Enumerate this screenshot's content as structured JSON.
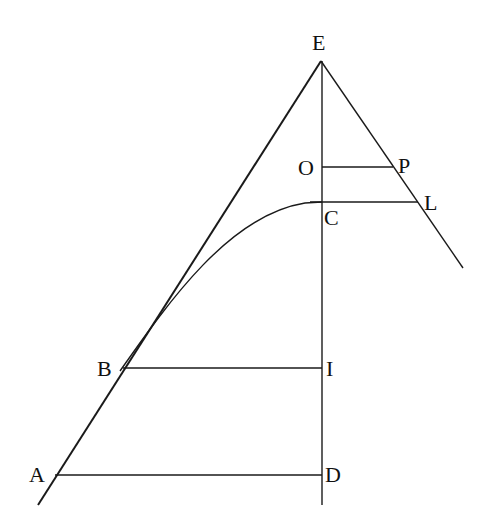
{
  "figure": {
    "type": "geometric-diagram",
    "stroke_color": "#1a1a1a",
    "background": "#ffffff"
  },
  "points": {
    "E": {
      "label": "E",
      "x": 321,
      "y": 61
    },
    "O": {
      "label": "O",
      "x": 322,
      "y": 167
    },
    "P": {
      "label": "P",
      "x": 393,
      "y": 167
    },
    "C": {
      "label": "C",
      "x": 322,
      "y": 202
    },
    "L": {
      "label": "L",
      "x": 418,
      "y": 202
    },
    "B": {
      "label": "B",
      "x": 122,
      "y": 368
    },
    "I": {
      "label": "I",
      "x": 322,
      "y": 368
    },
    "A": {
      "label": "A",
      "x": 55,
      "y": 475
    },
    "D": {
      "label": "D",
      "x": 322,
      "y": 475
    }
  },
  "labels": {
    "E": "E",
    "O": "O",
    "P": "P",
    "C": "C",
    "L": "L",
    "B": "B",
    "I": "I",
    "A": "A",
    "D": "D"
  },
  "segments": [
    {
      "name": "line-EA",
      "from": "E",
      "to": "A-extended"
    },
    {
      "name": "line-EL",
      "from": "E",
      "to": "L-extended"
    },
    {
      "name": "axis-ED",
      "from": "E",
      "to": "D-extended"
    },
    {
      "name": "segment-OP",
      "from": "O",
      "to": "P"
    },
    {
      "name": "segment-CL",
      "from": "C",
      "to": "L"
    },
    {
      "name": "segment-BI",
      "from": "B",
      "to": "I"
    },
    {
      "name": "segment-AD",
      "from": "A",
      "to": "D"
    }
  ],
  "curves": [
    {
      "name": "curve-BC",
      "from": "B",
      "to": "C",
      "note": "tangent to EA at B, horizontal at C"
    }
  ]
}
